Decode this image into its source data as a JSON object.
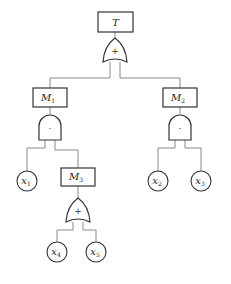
{
  "diagram": {
    "type": "fault-tree",
    "top_event": {
      "id": "T",
      "label": "T",
      "sub": ""
    },
    "gates": [
      {
        "id": "g_top",
        "kind": "OR",
        "symbol": "+",
        "output": "T",
        "inputs": [
          "M1",
          "M2"
        ]
      },
      {
        "id": "g_m1",
        "kind": "AND",
        "symbol": "·",
        "output": "M1",
        "inputs": [
          "x1",
          "M3"
        ]
      },
      {
        "id": "g_m2",
        "kind": "AND",
        "symbol": "·",
        "output": "M2",
        "inputs": [
          "x2",
          "x3"
        ]
      },
      {
        "id": "g_m3",
        "kind": "OR",
        "symbol": "+",
        "output": "M3",
        "inputs": [
          "x4",
          "x5"
        ]
      }
    ],
    "intermediate_events": [
      {
        "id": "M1",
        "label": "M",
        "sub": "1"
      },
      {
        "id": "M2",
        "label": "M",
        "sub": "2"
      },
      {
        "id": "M3",
        "label": "M",
        "sub": "3"
      }
    ],
    "basic_events": [
      {
        "id": "x1",
        "label": "x",
        "sub": "1"
      },
      {
        "id": "x2",
        "label": "x",
        "sub": "2"
      },
      {
        "id": "x3",
        "label": "x",
        "sub": "3"
      },
      {
        "id": "x4",
        "label": "x",
        "sub": "4"
      },
      {
        "id": "x5",
        "label": "x",
        "sub": "5"
      }
    ]
  }
}
